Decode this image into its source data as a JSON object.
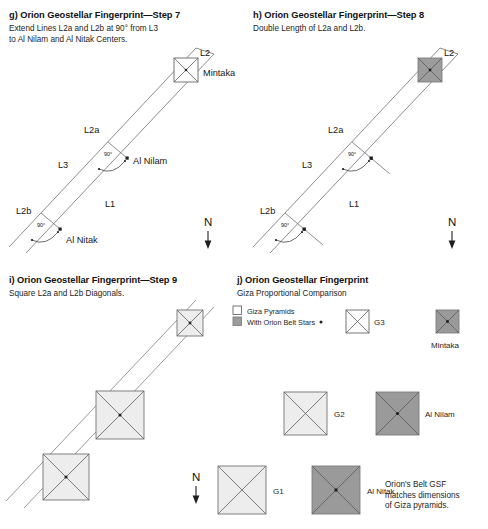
{
  "figure": {
    "panels": [
      {
        "id": "g",
        "title": "g) Orion Geostellar Fingerprint—Step 7",
        "subtitle": "Extend Lines L2a and L2b at 90° from L3\nto Al Nilam and Al Nitak Centers.",
        "labels": {
          "l1": "L1",
          "l2": "L2",
          "l3": "L3",
          "l2a": "L2a",
          "l2b": "L2b",
          "angle_a": "90°",
          "angle_b": "90°",
          "star_top": "Mintaka",
          "star_mid": "Al Nilam",
          "star_bottom": "Al Nitak",
          "compass": "N"
        }
      },
      {
        "id": "h",
        "title": "h) Orion Geostellar Fingerprint—Step 8",
        "subtitle": "Double Length of L2a and L2b.",
        "labels": {
          "l1": "L1",
          "l2": "L2",
          "l3": "L3",
          "l2a": "L2a",
          "l2b": "L2b",
          "angle_a": "90°",
          "angle_b": "90°",
          "compass": "N"
        }
      },
      {
        "id": "i",
        "title": "i) Orion Geostellar Fingerprint—Step 9",
        "subtitle": "Square L2a and L2b Diagonals.",
        "labels": {
          "compass": "N"
        }
      },
      {
        "id": "j",
        "title": "j) Orion Geostellar Fingerprint",
        "subtitle": "Giza Proportional Comparison",
        "legend": [
          {
            "swatch": "white",
            "label": "Giza Pyramids"
          },
          {
            "swatch": "gray",
            "label": "With Orion Belt Stars"
          }
        ],
        "comparisons": [
          {
            "pyramid": "G3",
            "star": "Mintaka"
          },
          {
            "pyramid": "G2",
            "star": "Al Nilam"
          },
          {
            "pyramid": "G1",
            "star": "Al Nitak"
          }
        ],
        "caption": "Orion's Belt GSF\nmatches dimensions\nof Giza pyramids."
      }
    ]
  },
  "colors": {
    "line": "#6f6f6f",
    "pyramid_fill": "#ededed",
    "star_fill": "#9c9c9c",
    "outline": "#5e5e5e",
    "text": "#1a1a1a"
  }
}
